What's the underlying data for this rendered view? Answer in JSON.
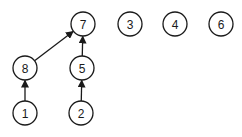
{
  "diagram": {
    "type": "directed-forest",
    "colors": {
      "stroke": "#1a1a1a",
      "fill": "#ffffff",
      "background": "#ffffff"
    },
    "node_radius": 12,
    "nodes": [
      {
        "id": "7",
        "label": "7",
        "x": 83,
        "y": 24
      },
      {
        "id": "3",
        "label": "3",
        "x": 130,
        "y": 24
      },
      {
        "id": "4",
        "label": "4",
        "x": 175,
        "y": 24
      },
      {
        "id": "6",
        "label": "6",
        "x": 221,
        "y": 24
      },
      {
        "id": "8",
        "label": "8",
        "x": 25,
        "y": 68
      },
      {
        "id": "5",
        "label": "5",
        "x": 82,
        "y": 68
      },
      {
        "id": "1",
        "label": "1",
        "x": 25,
        "y": 113
      },
      {
        "id": "2",
        "label": "2",
        "x": 81,
        "y": 113
      }
    ],
    "edges": [
      {
        "from": "8",
        "to": "7"
      },
      {
        "from": "5",
        "to": "7"
      },
      {
        "from": "1",
        "to": "8"
      },
      {
        "from": "2",
        "to": "5"
      }
    ]
  }
}
